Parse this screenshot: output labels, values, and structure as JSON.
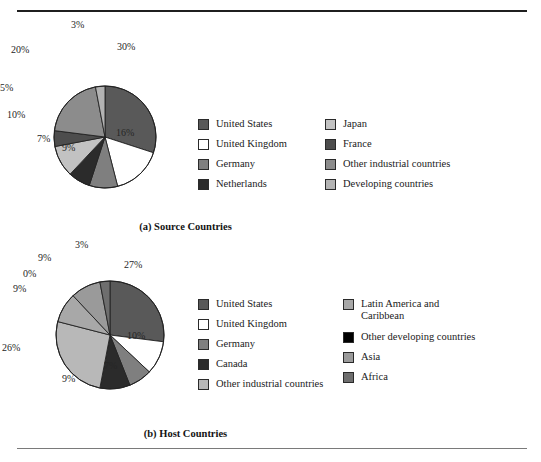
{
  "figure": {
    "background": "#ffffff",
    "rule_color_top": "#1f1f1f",
    "rule_color_bottom": "#7a7a7a"
  },
  "chart_data": [
    {
      "type": "pie",
      "title": "(a) Source Countries",
      "panel": "a",
      "legend_position": "right",
      "categories": [
        "United States",
        "United Kingdom",
        "Germany",
        "Netherlands",
        "France",
        "Japan",
        "Other industrial countries",
        "Developing countries"
      ],
      "values": [
        30,
        16,
        9,
        7,
        10,
        5,
        20,
        3
      ],
      "labels": [
        "30%",
        "16%",
        "9%",
        "7%",
        "10%",
        "5%",
        "20%",
        "3%"
      ],
      "colors": [
        "#595959",
        "#ffffff",
        "#7f7f7f",
        "#2b2b2b",
        "#4d4d4d",
        "#c2c2c2",
        "#8c8c8c",
        "#b3b3b3"
      ],
      "slice_order_clockwise_from_top": [
        {
          "name": "United States",
          "value": 30,
          "color": "#595959"
        },
        {
          "name": "United Kingdom",
          "value": 16,
          "color": "#ffffff"
        },
        {
          "name": "Germany",
          "value": 9,
          "color": "#7f7f7f"
        },
        {
          "name": "Netherlands",
          "value": 7,
          "color": "#2b2b2b"
        },
        {
          "name": "Japan",
          "value": 10,
          "color": "#c2c2c2"
        },
        {
          "name": "France",
          "value": 5,
          "color": "#4d4d4d"
        },
        {
          "name": "Other industrial countries",
          "value": 20,
          "color": "#8c8c8c"
        },
        {
          "name": "Developing countries",
          "value": 3,
          "color": "#b3b3b3"
        }
      ],
      "legend_columns": [
        [
          {
            "label": "United States",
            "color": "#595959"
          },
          {
            "label": "United Kingdom",
            "color": "#ffffff"
          },
          {
            "label": "Germany",
            "color": "#7f7f7f"
          },
          {
            "label": "Netherlands",
            "color": "#2b2b2b"
          }
        ],
        [
          {
            "label": "Japan",
            "color": "#c2c2c2"
          },
          {
            "label": "France",
            "color": "#4d4d4d"
          },
          {
            "label": "Other industrial countries",
            "color": "#8c8c8c"
          },
          {
            "label": "Developing countries",
            "color": "#b3b3b3"
          }
        ]
      ]
    },
    {
      "type": "pie",
      "title": "(b) Host Countries",
      "panel": "b",
      "legend_position": "right",
      "categories": [
        "United States",
        "United Kingdom",
        "Germany",
        "Canada",
        "Other industrial countries",
        "Latin America and Caribbean",
        "Other developing countries",
        "Asia",
        "Africa"
      ],
      "values": [
        27,
        10,
        7,
        9,
        26,
        9,
        0,
        9,
        3
      ],
      "labels": [
        "27%",
        "10%",
        "7%",
        "9%",
        "26%",
        "9%",
        "0%",
        "9%",
        "3%"
      ],
      "colors": [
        "#595959",
        "#ffffff",
        "#7f7f7f",
        "#2b2b2b",
        "#b8b8b8",
        "#a8a8a8",
        "#000000",
        "#9a9a9a",
        "#6e6e6e"
      ],
      "slice_order_clockwise_from_top": [
        {
          "name": "United States",
          "value": 27,
          "color": "#595959"
        },
        {
          "name": "United Kingdom",
          "value": 10,
          "color": "#ffffff"
        },
        {
          "name": "Germany",
          "value": 7,
          "color": "#7f7f7f"
        },
        {
          "name": "Canada",
          "value": 9,
          "color": "#2b2b2b"
        },
        {
          "name": "Other industrial countries",
          "value": 26,
          "color": "#b8b8b8"
        },
        {
          "name": "Latin America and Caribbean",
          "value": 9,
          "color": "#a8a8a8"
        },
        {
          "name": "Other developing countries",
          "value": 0,
          "color": "#000000"
        },
        {
          "name": "Asia",
          "value": 9,
          "color": "#9a9a9a"
        },
        {
          "name": "Africa",
          "value": 3,
          "color": "#6e6e6e"
        }
      ],
      "legend_columns": [
        [
          {
            "label": "United States",
            "color": "#595959"
          },
          {
            "label": "United Kingdom",
            "color": "#ffffff"
          },
          {
            "label": "Germany",
            "color": "#7f7f7f"
          },
          {
            "label": "Canada",
            "color": "#2b2b2b"
          },
          {
            "label": "Other industrial countries",
            "color": "#b8b8b8"
          }
        ],
        [
          {
            "label": "Latin America and\nCaribbean",
            "color": "#a8a8a8"
          },
          {
            "label": "Other developing countries",
            "color": "#000000"
          },
          {
            "label": "Asia",
            "color": "#9a9a9a"
          },
          {
            "label": "Africa",
            "color": "#6e6e6e"
          }
        ]
      ]
    }
  ],
  "panel_a": {
    "caption": "(a) Source Countries",
    "pct_labels": [
      {
        "text": "3%",
        "x": 71,
        "y": 0
      },
      {
        "text": "30%",
        "x": 117,
        "y": 22
      },
      {
        "text": "16%",
        "x": 116,
        "y": 108
      },
      {
        "text": "9%",
        "x": 62,
        "y": 123
      },
      {
        "text": "7%",
        "x": 37,
        "y": 114
      },
      {
        "text": "10%",
        "x": 7,
        "y": 90
      },
      {
        "text": "5%",
        "x": 0,
        "y": 63
      },
      {
        "text": "20%",
        "x": 11,
        "y": 25
      }
    ]
  },
  "panel_b": {
    "caption": "(b) Host Countries",
    "pct_labels": [
      {
        "text": "3%",
        "x": 75,
        "y": 0
      },
      {
        "text": "27%",
        "x": 124,
        "y": 20
      },
      {
        "text": "10%",
        "x": 127,
        "y": 91
      },
      {
        "text": "7%",
        "x": 104,
        "y": 121
      },
      {
        "text": "9%",
        "x": 62,
        "y": 134
      },
      {
        "text": "26%",
        "x": 2,
        "y": 103
      },
      {
        "text": "9%",
        "x": 13,
        "y": 44
      },
      {
        "text": "0%",
        "x": 23,
        "y": 29
      },
      {
        "text": "9%",
        "x": 38,
        "y": 13
      }
    ]
  }
}
